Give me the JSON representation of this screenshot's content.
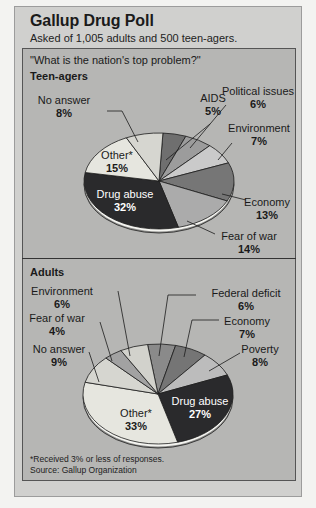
{
  "header": {
    "title": "Gallup Drug Poll",
    "subtitle": "Asked of 1,005 adults and 500 teen-agers."
  },
  "question": "\"What is the nation's top problem?\"",
  "footnotes": {
    "note": "*Received 3% or less of responses.",
    "source": "Source:  Gallup Organization"
  },
  "colors": {
    "page_bg": "#f3f3f1",
    "panel_bg": "#d0d0ce",
    "inner_bg": "#b6b6b4"
  },
  "chart_data": [
    {
      "type": "pie",
      "title": "Teen-agers",
      "unit": "%",
      "start_angle_deg": 3,
      "center": [
        159,
        181
      ],
      "rx": 75,
      "ry": 48,
      "slices": [
        {
          "label": "AIDS",
          "value": 5,
          "color": "#6f6f6f",
          "text_color": "#1a1a1a",
          "label_pos": [
            213,
            102
          ],
          "anchor": "middle",
          "leader": [
            [
              210,
              124
            ],
            [
              166,
              160
            ]
          ]
        },
        {
          "label": "Political issues",
          "value": 6,
          "color": "#9c9c9c",
          "text_color": "#1a1a1a",
          "label_pos": [
            258,
            95
          ],
          "anchor": "middle",
          "leader": [
            [
              226,
              105
            ],
            [
              190,
              148
            ]
          ]
        },
        {
          "label": "Environment",
          "value": 7,
          "color": "#cacaca",
          "text_color": "#1a1a1a",
          "label_pos": [
            259,
            132
          ],
          "anchor": "middle",
          "leader": [
            [
              232,
              143
            ],
            [
              218,
              160
            ]
          ]
        },
        {
          "label": "Economy",
          "value": 13,
          "color": "#767676",
          "text_color": "#1a1a1a",
          "label_pos": [
            267,
            206
          ],
          "anchor": "middle",
          "leader": [
            [
              246,
              200
            ],
            [
              222,
              194
            ]
          ]
        },
        {
          "label": "Fear of war",
          "value": 14,
          "color": "#ababab",
          "text_color": "#1a1a1a",
          "label_pos": [
            249,
            240
          ],
          "anchor": "middle",
          "leader": [
            [
              215,
              234
            ],
            [
              187,
              221
            ]
          ]
        },
        {
          "label": "Drug abuse",
          "value": 32,
          "color": "#2a2a2c",
          "text_color": "#ffffff",
          "label_pos": [
            125,
            198
          ],
          "anchor": "middle",
          "inside": true
        },
        {
          "label": "Other*",
          "value": 15,
          "color": "#e6e6df",
          "text_color": "#1a1a1a",
          "label_pos": [
            117,
            159
          ],
          "anchor": "middle",
          "inside": true
        },
        {
          "label": "No answer",
          "value": 8,
          "color": "#d6d6d0",
          "text_color": "#1a1a1a",
          "label_pos": [
            64,
            104
          ],
          "anchor": "middle",
          "leader": [
            [
              107,
              111
            ],
            [
              122,
              111
            ],
            [
              138,
              142
            ]
          ]
        }
      ]
    },
    {
      "type": "pie",
      "title": "Adults",
      "unit": "%",
      "start_angle_deg": -8,
      "center": [
        158,
        394
      ],
      "rx": 75,
      "ry": 50,
      "slices": [
        {
          "label": "Federal deficit",
          "value": 6,
          "color": "#8a8a8a",
          "text_color": "#1a1a1a",
          "label_pos": [
            246,
            297
          ],
          "anchor": "middle",
          "leader": [
            [
              196,
              295
            ],
            [
              168,
              295
            ],
            [
              159,
              356
            ]
          ]
        },
        {
          "label": "Economy",
          "value": 7,
          "color": "#757575",
          "text_color": "#1a1a1a",
          "label_pos": [
            247,
            325
          ],
          "anchor": "middle",
          "leader": [
            [
              219,
              320
            ],
            [
              192,
              320
            ],
            [
              184,
              357
            ]
          ]
        },
        {
          "label": "Poverty",
          "value": 8,
          "color": "#bcbcbc",
          "text_color": "#1a1a1a",
          "label_pos": [
            260,
            353
          ],
          "anchor": "middle",
          "leader": [
            [
              240,
              353
            ],
            [
              209,
              371
            ]
          ]
        },
        {
          "label": "Drug abuse",
          "value": 27,
          "color": "#2a2a2c",
          "text_color": "#ffffff",
          "label_pos": [
            200,
            405
          ],
          "anchor": "middle",
          "inside": true
        },
        {
          "label": "Other*",
          "value": 33,
          "color": "#e6e6df",
          "text_color": "#1a1a1a",
          "label_pos": [
            136,
            417
          ],
          "anchor": "middle",
          "inside": true
        },
        {
          "label": "No answer",
          "value": 9,
          "color": "#d6d6d0",
          "text_color": "#1a1a1a",
          "label_pos": [
            59,
            353
          ],
          "anchor": "middle",
          "leader": [
            [
              89,
              352
            ],
            [
              99,
              382
            ]
          ]
        },
        {
          "label": "Fear of war",
          "value": 4,
          "color": "#a2a2a2",
          "text_color": "#1a1a1a",
          "label_pos": [
            57,
            322
          ],
          "anchor": "middle",
          "leader": [
            [
              100,
              322
            ],
            [
              112,
              361
            ]
          ]
        },
        {
          "label": "Environment",
          "value": 6,
          "color": "#d2d2cc",
          "text_color": "#1a1a1a",
          "label_pos": [
            62,
            295
          ],
          "anchor": "middle",
          "leader": [
            [
              118,
              291
            ],
            [
              130,
              356
            ]
          ]
        }
      ]
    }
  ]
}
